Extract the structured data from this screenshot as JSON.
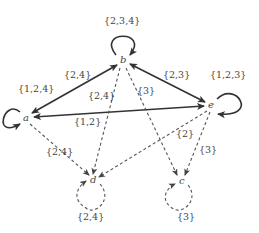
{
  "diagram": {
    "nodes": [
      {
        "id": "a",
        "label": "a",
        "x": 26,
        "y": 118
      },
      {
        "id": "b",
        "label": "b",
        "x": 123,
        "y": 61
      },
      {
        "id": "e",
        "label": "e",
        "x": 211,
        "y": 105
      },
      {
        "id": "d",
        "label": "d",
        "x": 93,
        "y": 180
      },
      {
        "id": "c",
        "label": "c",
        "x": 181,
        "y": 181
      }
    ],
    "edges": [
      {
        "from": "a",
        "to": "b",
        "label": "{2,4}",
        "style": "solid",
        "bidirectional": true
      },
      {
        "from": "b",
        "to": "e",
        "label": "{2,3}",
        "style": "solid",
        "bidirectional": true
      },
      {
        "from": "e",
        "to": "a",
        "label": "{1,2}",
        "style": "solid",
        "bidirectional": true
      },
      {
        "from": "a",
        "to": "d",
        "label": "{2,4}",
        "style": "dashed"
      },
      {
        "from": "b",
        "to": "d",
        "label": "{2,4}",
        "style": "dashed"
      },
      {
        "from": "b",
        "to": "c",
        "label": "{3}",
        "style": "dashed"
      },
      {
        "from": "e",
        "to": "d",
        "label": "{2}",
        "style": "dashed"
      },
      {
        "from": "e",
        "to": "c",
        "label": "{3}",
        "style": "dashed"
      }
    ],
    "loops": [
      {
        "node": "a",
        "label": "{1,2,4}",
        "style": "solid"
      },
      {
        "node": "b",
        "label": "{2,3,4}",
        "style": "solid"
      },
      {
        "node": "e",
        "label": "{1,2,3}",
        "style": "solid"
      },
      {
        "node": "d",
        "label": "{2,4}",
        "style": "dashed"
      },
      {
        "node": "c",
        "label": "{3}",
        "style": "dashed"
      }
    ]
  },
  "labels": {
    "node_a": "a",
    "node_b": "b",
    "node_e": "e",
    "node_d": "d",
    "node_c": "c",
    "loop_a": "{1,2,4}",
    "loop_b": "{2,3,4}",
    "loop_e": "{1,2,3}",
    "loop_d": "{2,4}",
    "loop_c": "{3}",
    "edge_ab": "{2,4}",
    "edge_be": "{2,3}",
    "edge_ea": "{1,2}",
    "edge_ad": "{2,4}",
    "edge_bd": "{2,4}",
    "edge_bc": "{3}",
    "edge_ed": "{2}",
    "edge_ec": "{3}"
  }
}
